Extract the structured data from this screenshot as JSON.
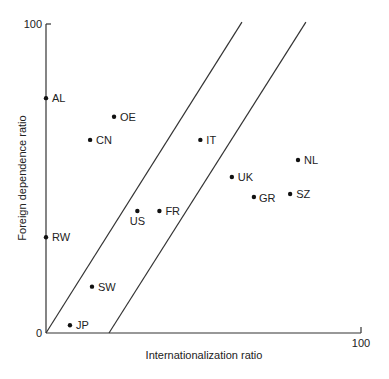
{
  "chart_data": {
    "type": "scatter",
    "title": "",
    "xlabel": "Internationalization ratio",
    "ylabel": "Foreign dependence ratio",
    "xlim": [
      0,
      100
    ],
    "ylim": [
      0,
      100
    ],
    "x_ticks": [
      "0",
      "100"
    ],
    "y_ticks": [
      "0",
      "100"
    ],
    "grid": false,
    "legend": null,
    "points": [
      {
        "label": "AL",
        "x": 0,
        "y": 76
      },
      {
        "label": "OE",
        "x": 21.6,
        "y": 70
      },
      {
        "label": "CN",
        "x": 14,
        "y": 62.5
      },
      {
        "label": "IT",
        "x": 49,
        "y": 62.5
      },
      {
        "label": "NL",
        "x": 80,
        "y": 56
      },
      {
        "label": "UK",
        "x": 59,
        "y": 50.5
      },
      {
        "label": "GR",
        "x": 66,
        "y": 44
      },
      {
        "label": "SZ",
        "x": 77.5,
        "y": 45
      },
      {
        "label": "US",
        "x": 29,
        "y": 39.5
      },
      {
        "label": "FR",
        "x": 36,
        "y": 39.5
      },
      {
        "label": "RW",
        "x": 0,
        "y": 31
      },
      {
        "label": "SW",
        "x": 14.6,
        "y": 15
      },
      {
        "label": "JP",
        "x": 7.6,
        "y": 2.5
      }
    ],
    "reference_lines": [
      {
        "name": "upper-diagonal",
        "from": [
          0,
          0
        ],
        "to": [
          62.2,
          100.6
        ]
      },
      {
        "name": "lower-diagonal",
        "from": [
          20,
          0
        ],
        "to": [
          82.5,
          100.6
        ]
      }
    ]
  },
  "axes": {
    "x_label": "Internationalization ratio",
    "y_label": "Foreign dependence ratio",
    "origin_label": "0",
    "x_max_label": "100",
    "y_max_label": "100"
  }
}
